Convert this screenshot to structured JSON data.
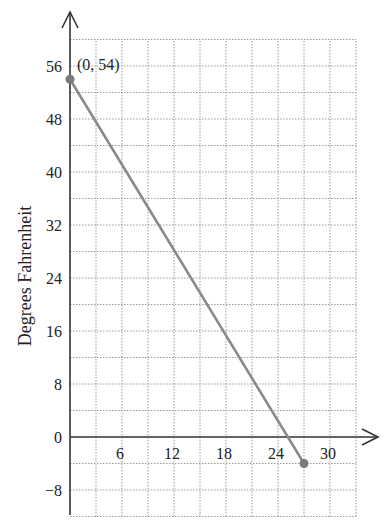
{
  "chart_data": {
    "type": "line",
    "title": "",
    "xlabel": "",
    "ylabel": "Degrees Fahrenheit",
    "xlim": [
      0,
      33
    ],
    "ylim": [
      -12,
      60
    ],
    "x_ticks": [
      6,
      12,
      18,
      24,
      30
    ],
    "y_ticks": [
      -8,
      0,
      8,
      16,
      24,
      32,
      40,
      48,
      56
    ],
    "x_grid_step": 3,
    "y_grid_step": 4,
    "grid": true,
    "legend": null,
    "series": [
      {
        "name": "temperature",
        "x": [
          0,
          27
        ],
        "y": [
          54,
          -4
        ],
        "color": "#8a8a8a"
      }
    ],
    "annotations": [
      {
        "text": "(0, 54)",
        "x": 0,
        "y": 54
      }
    ]
  },
  "labels": {
    "ylabel": "Degrees Fahrenheit",
    "point_annotation": "(0, 54)",
    "x_tick_labels": [
      "6",
      "12",
      "18",
      "24",
      "30"
    ],
    "y_tick_labels": [
      "56",
      "48",
      "40",
      "32",
      "24",
      "16",
      "8",
      "0",
      "−8"
    ]
  }
}
